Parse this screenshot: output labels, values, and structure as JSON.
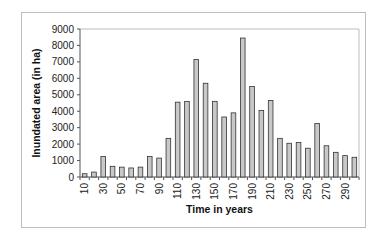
{
  "chart_data": {
    "type": "bar",
    "title": "",
    "xlabel": "Time in years",
    "ylabel": "Inundated area (in ha)",
    "ylim": [
      0,
      9000
    ],
    "yticks": [
      0,
      1000,
      2000,
      3000,
      4000,
      5000,
      6000,
      7000,
      8000,
      9000
    ],
    "xtick_labels": [
      "10",
      "30",
      "50",
      "70",
      "90",
      "110",
      "130",
      "150",
      "170",
      "190",
      "210",
      "230",
      "250",
      "270",
      "290"
    ],
    "categories": [
      10,
      20,
      30,
      40,
      50,
      60,
      70,
      80,
      90,
      100,
      110,
      120,
      130,
      140,
      150,
      160,
      170,
      180,
      190,
      200,
      210,
      220,
      230,
      240,
      250,
      260,
      270,
      280,
      290,
      300
    ],
    "values": [
      200,
      300,
      1250,
      650,
      600,
      550,
      600,
      1250,
      1150,
      2350,
      4550,
      4600,
      7150,
      5700,
      4600,
      3650,
      3900,
      8450,
      5500,
      4050,
      4650,
      2350,
      2050,
      2100,
      1750,
      3250,
      1900,
      1500,
      1300,
      1200
    ],
    "grid": false,
    "legend": null,
    "colors": {
      "bar_fill": "#c8c8c8",
      "bar_stroke": "#333333",
      "axis": "#555555",
      "frame": "#bdbdbd"
    }
  }
}
